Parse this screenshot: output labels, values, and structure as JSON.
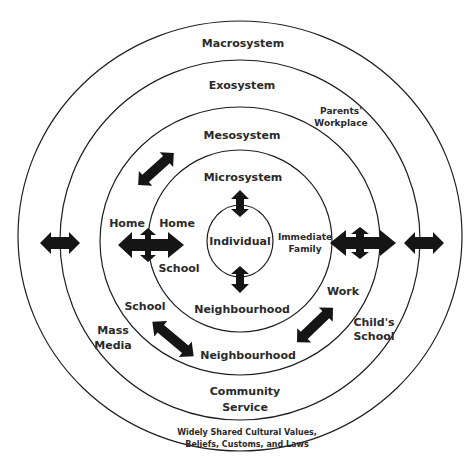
{
  "diagram": {
    "systems": {
      "macrosystem": "Macrosystem",
      "exosystem": "Exosystem",
      "mesosystem": "Mesosystem",
      "microsystem": "Microsystem",
      "individual": "Individual"
    },
    "microsystem_items": {
      "home": "Home",
      "school": "School",
      "immediate_family_line1": "Immediate",
      "immediate_family_line2": "Family",
      "neighbourhood": "Neighbourhood"
    },
    "mesosystem_items": {
      "home": "Home",
      "school": "School",
      "work": "Work",
      "neighbourhood": "Neighbourhood"
    },
    "exosystem_items": {
      "parents_workplace_line1": "Parents'",
      "parents_workplace_line2": "Workplace",
      "mass_media_line1": "Mass",
      "mass_media_line2": "Media",
      "childs_school_line1": "Child's",
      "childs_school_line2": "School",
      "community_service_line1": "Community",
      "community_service_line2": "Service"
    },
    "macrosystem_items": {
      "cultural_values_line1": "Widely Shared Cultural Values,",
      "cultural_values_line2": "Beliefs, Customs, and Laws"
    },
    "rings": [
      {
        "name": "macrosystem-ring",
        "cx": 240,
        "cy": 236,
        "rx": 222,
        "ry": 215
      },
      {
        "name": "exosystem-ring",
        "cx": 240,
        "cy": 240,
        "rx": 180,
        "ry": 180
      },
      {
        "name": "mesosystem-ring",
        "cx": 240,
        "cy": 241,
        "rx": 140,
        "ry": 134
      },
      {
        "name": "microsystem-ring",
        "cx": 240,
        "cy": 241,
        "rx": 92,
        "ry": 91
      },
      {
        "name": "individual-ring",
        "cx": 240,
        "cy": 241,
        "rx": 33,
        "ry": 36
      }
    ],
    "colors": {
      "line": "#1e1e1e",
      "arrow": "#151515",
      "text": "#2a2a2a",
      "background": "#ffffff"
    }
  }
}
